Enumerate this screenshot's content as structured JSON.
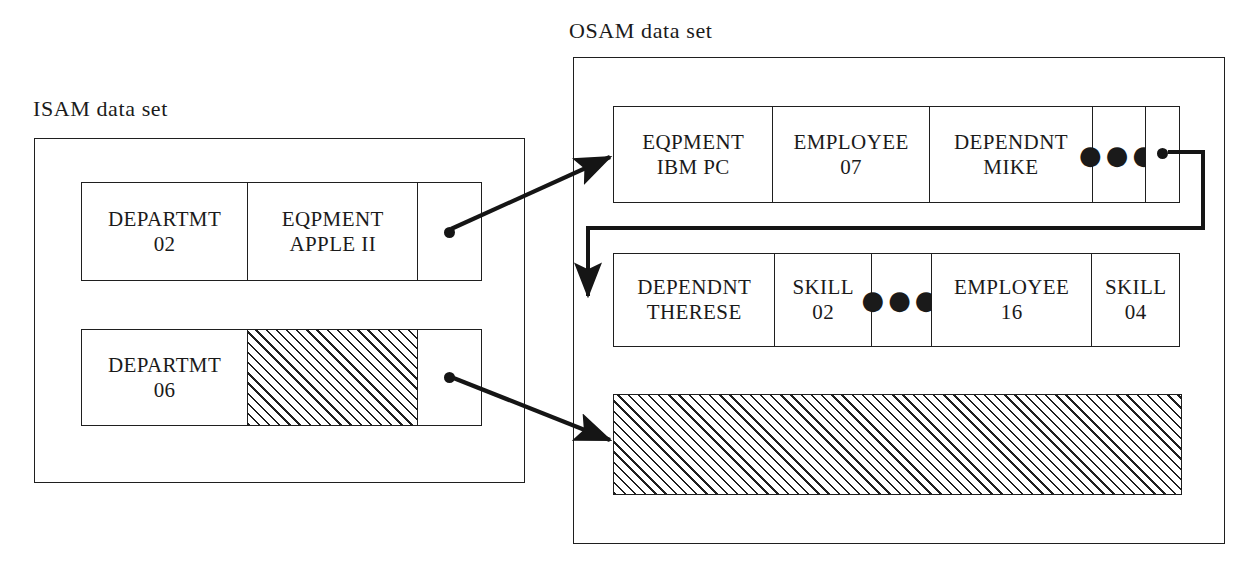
{
  "diagram": {
    "line_color": "#1f1f1f",
    "background": "#ffffff"
  },
  "isam": {
    "label": "ISAM data set",
    "records": [
      {
        "name": "isam-record-1",
        "cells": [
          {
            "type": "segment",
            "line1": "DEPARTMT",
            "line2": "02"
          },
          {
            "type": "segment",
            "line1": "EQPMENT",
            "line2": "APPLE II"
          },
          {
            "type": "pointer",
            "line1": "",
            "line2": ""
          }
        ]
      },
      {
        "name": "isam-record-2",
        "cells": [
          {
            "type": "segment",
            "line1": "DEPARTMT",
            "line2": "06"
          },
          {
            "type": "hatched",
            "line1": "",
            "line2": ""
          },
          {
            "type": "pointer",
            "line1": "",
            "line2": ""
          }
        ]
      }
    ]
  },
  "osam": {
    "label": "OSAM data set",
    "records": [
      {
        "name": "osam-record-1",
        "cells": [
          {
            "type": "segment",
            "line1": "EQPMENT",
            "line2": "IBM PC"
          },
          {
            "type": "segment",
            "line1": "EMPLOYEE",
            "line2": "07"
          },
          {
            "type": "segment",
            "line1": "DEPENDNT",
            "line2": "MIKE"
          },
          {
            "type": "ellipsis",
            "glyph": "●●●"
          },
          {
            "type": "pointer",
            "line1": "",
            "line2": ""
          }
        ]
      },
      {
        "name": "osam-record-2",
        "cells": [
          {
            "type": "segment",
            "line1": "DEPENDNT",
            "line2": "THERESE"
          },
          {
            "type": "segment",
            "line1": "SKILL",
            "line2": "02"
          },
          {
            "type": "ellipsis",
            "glyph": "●●●"
          },
          {
            "type": "segment",
            "line1": "EMPLOYEE",
            "line2": "16"
          },
          {
            "type": "segment",
            "line1": "SKILL",
            "line2": "04"
          }
        ]
      }
    ],
    "free_space_block": {
      "type": "hatched",
      "label": ""
    }
  },
  "connectors": [
    {
      "name": "isam-rec1-to-osam-rec1",
      "from": "isam-record-1 pointer",
      "to": "osam-record-1 left edge",
      "style": "arrow"
    },
    {
      "name": "isam-rec2-to-osam-free-space",
      "from": "isam-record-2 pointer",
      "to": "osam free space block left edge",
      "style": "arrow"
    },
    {
      "name": "osam-rec1-to-osam-rec2",
      "from": "osam-record-1 pointer",
      "to": "osam-record-2 left edge",
      "style": "orthogonal-arrow"
    }
  ]
}
